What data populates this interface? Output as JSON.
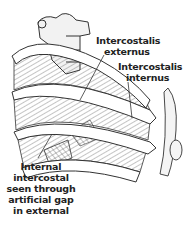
{
  "figure": {
    "labels": {
      "externus": [
        "Intercostalis",
        "externus"
      ],
      "internus": [
        "Intercostalis",
        "internus"
      ],
      "gap": [
        "Internal",
        "intercostal",
        "seen through",
        "artificial gap",
        "in external"
      ]
    },
    "colors": {
      "line": "#333333",
      "background": "#ffffff",
      "shade": "#d8d8d8"
    }
  }
}
